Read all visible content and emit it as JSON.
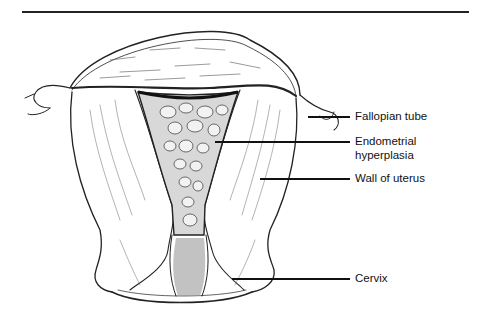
{
  "figure": {
    "labels": [
      {
        "id": "fallopian-tube",
        "text": "Fallopian tube"
      },
      {
        "id": "endometrial-hyperplasia",
        "line1": "Endometrial",
        "line2": "hyperplasia"
      },
      {
        "id": "wall-of-uterus",
        "text": "Wall of uterus"
      },
      {
        "id": "cervix",
        "text": "Cervix"
      }
    ]
  }
}
